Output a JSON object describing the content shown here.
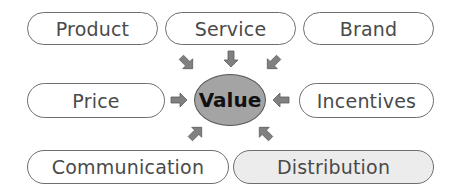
{
  "diagram": {
    "center": {
      "label": "Value",
      "fill": "#a4a4a4"
    },
    "nodes": [
      {
        "id": "product",
        "label": "Product",
        "fill": "#ffffff"
      },
      {
        "id": "service",
        "label": "Service",
        "fill": "#ffffff"
      },
      {
        "id": "brand",
        "label": "Brand",
        "fill": "#ffffff"
      },
      {
        "id": "price",
        "label": "Price",
        "fill": "#ffffff"
      },
      {
        "id": "incentives",
        "label": "Incentives",
        "fill": "#ffffff"
      },
      {
        "id": "communication",
        "label": "Communication",
        "fill": "#ffffff"
      },
      {
        "id": "distribution",
        "label": "Distribution",
        "fill": "#ececec"
      }
    ],
    "edges": [
      {
        "from": "product",
        "to": "value"
      },
      {
        "from": "service",
        "to": "value"
      },
      {
        "from": "brand",
        "to": "value"
      },
      {
        "from": "price",
        "to": "value"
      },
      {
        "from": "incentives",
        "to": "value"
      },
      {
        "from": "communication",
        "to": "value"
      },
      {
        "from": "distribution",
        "to": "value"
      }
    ],
    "arrow_color": "#808080"
  }
}
